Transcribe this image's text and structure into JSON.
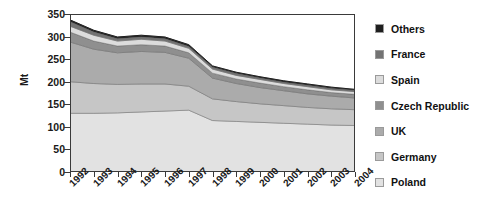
{
  "chart_data": {
    "type": "area",
    "stacked": true,
    "title": "",
    "subtitle": "",
    "xlabel": "",
    "ylabel": "Mt",
    "categories": [
      "1992",
      "1993",
      "1994",
      "1995",
      "1996",
      "1997",
      "1998",
      "1999",
      "2000",
      "2001",
      "2002",
      "2003",
      "2004"
    ],
    "x": [
      1992,
      1993,
      1994,
      1995,
      1996,
      1997,
      1998,
      1999,
      2000,
      2001,
      2002,
      2003,
      2004
    ],
    "ylim": [
      0,
      350
    ],
    "yticks": [
      0,
      50,
      100,
      150,
      200,
      250,
      300,
      350
    ],
    "grid": false,
    "legend_position": "right",
    "stack_order_bottom_to_top": [
      "Poland",
      "Germany",
      "UK",
      "Czech Republic",
      "Spain",
      "France",
      "Others"
    ],
    "series": [
      {
        "name": "Poland",
        "color": "#e2e2e2",
        "values": [
          130,
          130,
          131,
          133,
          135,
          137,
          114,
          112,
          110,
          108,
          106,
          104,
          103
        ]
      },
      {
        "name": "Germany",
        "color": "#c6c6c6",
        "values": [
          70,
          66,
          63,
          62,
          60,
          53,
          48,
          44,
          41,
          39,
          37,
          36,
          35
        ]
      },
      {
        "name": "UK",
        "color": "#ababab",
        "values": [
          88,
          76,
          70,
          72,
          70,
          62,
          46,
          40,
          36,
          33,
          30,
          28,
          26
        ]
      },
      {
        "name": "Czech Republic",
        "color": "#8f8f8f",
        "values": [
          22,
          18,
          15,
          15,
          14,
          12,
          11,
          10,
          10,
          9,
          9,
          8,
          8
        ]
      },
      {
        "name": "Spain",
        "color": "#dcdcdc",
        "values": [
          13,
          13,
          11,
          12,
          11,
          10,
          9,
          8,
          8,
          7,
          7,
          6,
          6
        ]
      },
      {
        "name": "France",
        "color": "#737373",
        "values": [
          10,
          7,
          5,
          5,
          5,
          4,
          4,
          4,
          3,
          3,
          3,
          3,
          3
        ]
      },
      {
        "name": "Others",
        "color": "#1e1e1e",
        "values": [
          4,
          4,
          4,
          4,
          4,
          4,
          3,
          3,
          3,
          3,
          3,
          3,
          2
        ]
      }
    ],
    "totals": [
      337,
      314,
      299,
      303,
      299,
      282,
      235,
      221,
      211,
      202,
      195,
      188,
      183
    ],
    "units": "Mt"
  },
  "axes": {
    "y_title": "Mt",
    "y_tick_labels": [
      "350",
      "300",
      "250",
      "200",
      "150",
      "100",
      "50",
      "0"
    ],
    "x_tick_labels": [
      "1992",
      "1993",
      "1994",
      "1995",
      "1996",
      "1997",
      "1998",
      "1999",
      "2000",
      "2001",
      "2002",
      "2003",
      "2004"
    ]
  },
  "legend": {
    "items": [
      {
        "label": "Others",
        "color": "#1e1e1e"
      },
      {
        "label": "France",
        "color": "#737373"
      },
      {
        "label": "Spain",
        "color": "#dcdcdc"
      },
      {
        "label": "Czech Republic",
        "color": "#8f8f8f"
      },
      {
        "label": "UK",
        "color": "#ababab"
      },
      {
        "label": "Germany",
        "color": "#c6c6c6"
      },
      {
        "label": "Poland",
        "color": "#e2e2e2"
      }
    ]
  }
}
